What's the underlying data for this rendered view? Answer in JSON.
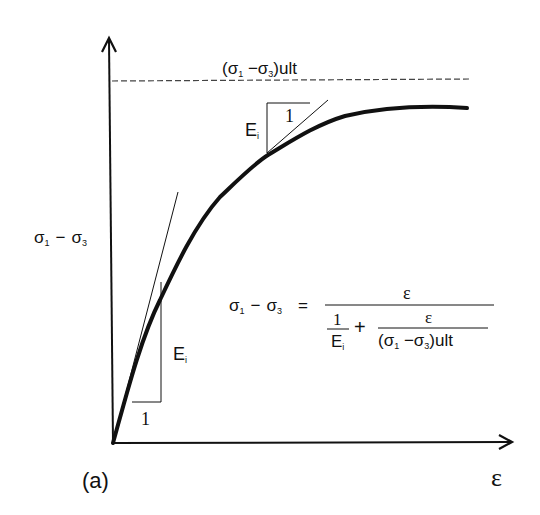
{
  "figure": {
    "panel_label": "(a)",
    "colors": {
      "background": "#ffffff",
      "ink": "#111111",
      "dashed": "#444444"
    }
  },
  "axes": {
    "x_label": "ε",
    "y_label": {
      "sigma1": "σ",
      "sub1": "1",
      "minus": "−",
      "sigma3": "σ",
      "sub3": "3"
    }
  },
  "asymptote": {
    "label_open": "(σ",
    "label_sub1": "1",
    "label_minus": " −σ",
    "label_sub3": "3",
    "label_close": ")ult",
    "style": "dashed"
  },
  "upper_tangent_triangle": {
    "e_label": "E",
    "e_sub": "i",
    "run_label": "1"
  },
  "lower_tangent_triangle": {
    "e_label": "E",
    "e_sub": "i",
    "run_label": "1"
  },
  "equation": {
    "lhs_sigma1": "σ",
    "lhs_sub1": "1",
    "lhs_minus": "−",
    "lhs_sigma3": "σ",
    "lhs_sub3": "3",
    "equals": "=",
    "numerator": "ε",
    "denom_term1_num": "1",
    "denom_term1_den": "E",
    "denom_term1_den_sub": "i",
    "plus": "+",
    "denom_term2_num": "ε",
    "denom_term2_den_open": "(σ",
    "denom_term2_den_sub1": "1",
    "denom_term2_den_minus": " −σ",
    "denom_term2_den_sub3": "3",
    "denom_term2_den_close": ")ult"
  },
  "curve": {
    "description": "hyperbolic stress-strain curve approaching ultimate deviator stress asymptote",
    "points": [
      [
        113,
        443
      ],
      [
        135,
        370
      ],
      [
        160,
        300
      ],
      [
        185,
        240
      ],
      [
        220,
        195
      ],
      [
        268,
        155
      ],
      [
        300,
        138
      ],
      [
        340,
        117
      ],
      [
        380,
        110
      ],
      [
        420,
        107
      ],
      [
        467,
        108
      ]
    ]
  }
}
